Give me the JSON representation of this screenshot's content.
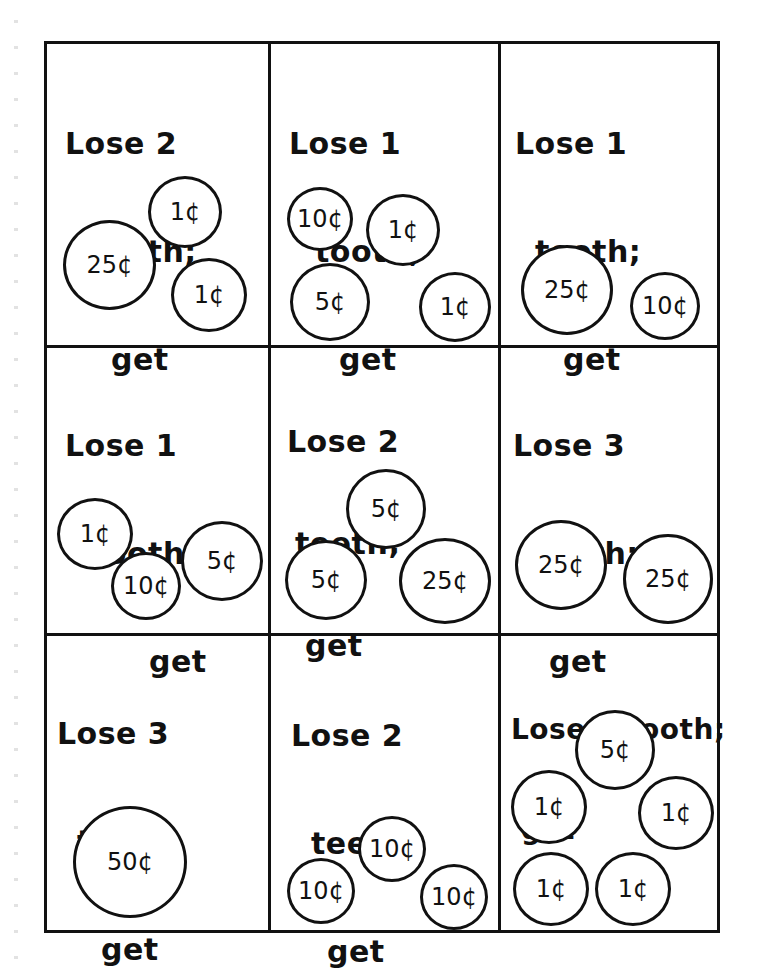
{
  "worksheet": {
    "cells": [
      {
        "lines": [
          "Lose 2",
          "teeth;",
          "get"
        ],
        "coins": [
          "1¢",
          "25¢",
          "1¢"
        ]
      },
      {
        "lines": [
          "Lose 1",
          "tooth;",
          "get"
        ],
        "coins": [
          "10¢",
          "1¢",
          "5¢",
          "1¢"
        ]
      },
      {
        "lines": [
          "Lose 1",
          "tooth;",
          "get"
        ],
        "coins": [
          "25¢",
          "10¢"
        ]
      },
      {
        "lines": [
          "Lose 1",
          "tooth;",
          "get"
        ],
        "coins": [
          "1¢",
          "10¢",
          "5¢"
        ]
      },
      {
        "lines": [
          "Lose 2",
          "teeth;",
          "get"
        ],
        "coins": [
          "5¢",
          "5¢",
          "25¢"
        ]
      },
      {
        "lines": [
          "Lose 3",
          "teeth;",
          "get"
        ],
        "coins": [
          "25¢",
          "25¢"
        ]
      },
      {
        "lines": [
          "Lose 3",
          "teeth;",
          "get"
        ],
        "coins": [
          "50¢"
        ]
      },
      {
        "lines": [
          "Lose 2",
          "teeth;",
          "get"
        ],
        "coins": [
          "10¢",
          "10¢",
          "10¢"
        ]
      },
      {
        "lines": [
          "Lose 1 tooth;",
          "get"
        ],
        "coins": [
          "5¢",
          "1¢",
          "1¢",
          "1¢",
          "1¢"
        ]
      }
    ]
  }
}
